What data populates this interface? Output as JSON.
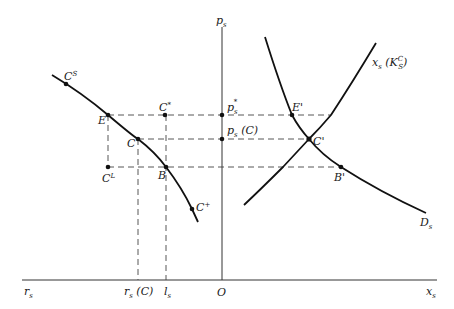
{
  "figure": {
    "axes": {
      "vertical_label": "p",
      "vertical_label_sub": "s",
      "horizontal_right_label": "x",
      "horizontal_right_label_sub": "s",
      "horizontal_left_label": "r",
      "horizontal_left_label_sub": "s",
      "origin_label": "O"
    },
    "ticks": {
      "rs_c_main": "r",
      "rs_c_sub": "s",
      "rs_c_paren": " (C)",
      "ls_main": "l",
      "ls_sub": "s"
    },
    "price_labels": {
      "p_star_main": "p",
      "p_star_sub": "s",
      "p_star_sup": "*",
      "p_c_main": "p",
      "p_c_sub": "s",
      "p_c_paren": " (C)"
    },
    "left_points": {
      "cs_main": "C",
      "cs_sup": "S",
      "e": "E",
      "cstar_main": "C",
      "cstar_sup": "*",
      "c": "C",
      "cl_main": "C",
      "cl_sup": "L",
      "b": "B",
      "cplus_main": "C",
      "cplus_sup": "+"
    },
    "right_points": {
      "e_prime": "E'",
      "c_prime": "C'",
      "b_prime": "B'"
    },
    "curves": {
      "supply_main": "x",
      "supply_sub": "s",
      "supply_paren_open": " (K",
      "supply_sup": "C",
      "supply_sub2": "S",
      "supply_paren_close": ")",
      "demand_main": "D",
      "demand_sub": "s"
    }
  }
}
